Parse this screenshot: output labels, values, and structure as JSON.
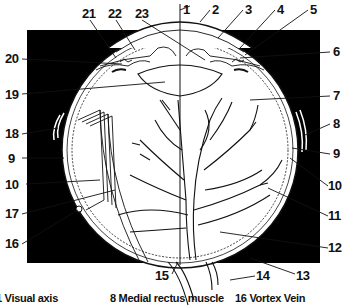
{
  "diagram": {
    "colors": {
      "background": "#000000",
      "ink": "#111111",
      "paper": "#ffffff"
    },
    "labels": [
      {
        "num": "1",
        "x": 183,
        "y": 14
      },
      {
        "num": "2",
        "x": 212,
        "y": 14
      },
      {
        "num": "3",
        "x": 245,
        "y": 14
      },
      {
        "num": "4",
        "x": 277,
        "y": 14
      },
      {
        "num": "5",
        "x": 310,
        "y": 14
      },
      {
        "num": "6",
        "x": 333,
        "y": 56
      },
      {
        "num": "7",
        "x": 333,
        "y": 100
      },
      {
        "num": "8",
        "x": 333,
        "y": 128
      },
      {
        "num": "9",
        "x": 333,
        "y": 158
      },
      {
        "num": "10",
        "x": 330,
        "y": 190
      },
      {
        "num": "11",
        "x": 330,
        "y": 220
      },
      {
        "num": "12",
        "x": 330,
        "y": 252
      },
      {
        "num": "13",
        "x": 297,
        "y": 278
      },
      {
        "num": "14",
        "x": 257,
        "y": 278
      },
      {
        "num": "15",
        "x": 163,
        "y": 278
      },
      {
        "num": "16",
        "x": 5,
        "y": 248
      },
      {
        "num": "17",
        "x": 5,
        "y": 218
      },
      {
        "num": "18",
        "x": 5,
        "y": 137
      },
      {
        "num": "9b",
        "text": "9",
        "x": 8,
        "y": 162
      },
      {
        "num": "10b",
        "text": "10",
        "x": 5,
        "y": 188
      },
      {
        "num": "19",
        "x": 5,
        "y": 98
      },
      {
        "num": "20",
        "x": 5,
        "y": 63
      },
      {
        "num": "21",
        "x": 82,
        "y": 18
      },
      {
        "num": "22",
        "x": 108,
        "y": 18
      },
      {
        "num": "23",
        "x": 135,
        "y": 18
      }
    ],
    "legend": [
      {
        "text": "1 Visual axis"
      },
      {
        "text": "8 Medial rectus muscle"
      },
      {
        "text": "16 Vortex Vein"
      }
    ]
  }
}
